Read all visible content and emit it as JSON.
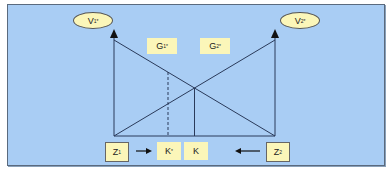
{
  "diagram": {
    "labels": {
      "v1": {
        "base": "V",
        "sub": "1",
        "sup": "*"
      },
      "v2": {
        "base": "V",
        "sub": "2",
        "sup": "*"
      },
      "g1": {
        "base": "G",
        "sub": "1",
        "sup": "*"
      },
      "g2": {
        "base": "G",
        "sub": "2",
        "sup": "*"
      },
      "z1": {
        "base": "Z",
        "sub": "1"
      },
      "z2": {
        "base": "Z",
        "sub": "2"
      },
      "k_star": {
        "base": "K",
        "sup": "*"
      },
      "k": {
        "base": "K"
      }
    },
    "colors": {
      "panel_bg": "#a9cdf4",
      "label_bg": "#fbf6b9",
      "line": "#2a3a5a"
    }
  }
}
